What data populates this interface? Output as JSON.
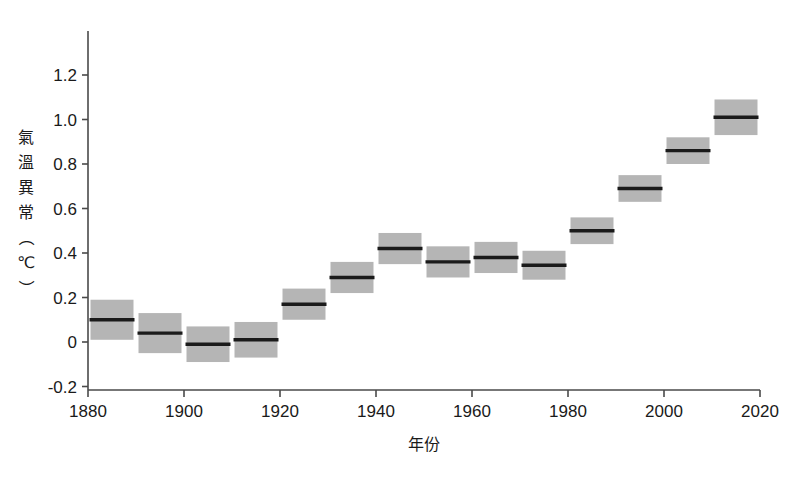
{
  "figure": {
    "cropped_header_text": "······ ···· ·· ·· ·······"
  },
  "chart_data": {
    "type": "bar",
    "title": "",
    "subtitle": "",
    "xlabel": "年份",
    "ylabel": "氣溫異常（℃）",
    "ylabel_chars": [
      "氣",
      "溫",
      "異",
      "常",
      "（",
      "℃",
      "）"
    ],
    "xlim": [
      1880,
      2020
    ],
    "ylim": [
      -0.3,
      1.25
    ],
    "grid": false,
    "legend": null,
    "xticks": [
      "1880",
      "1900",
      "1920",
      "1940",
      "1960",
      "1980",
      "2000",
      "2020"
    ],
    "xtick_values": [
      1880,
      1900,
      1920,
      1940,
      1960,
      1980,
      2000,
      2020
    ],
    "yticks": [
      "1.2",
      "1.0",
      "0.8",
      "0.6",
      "0.4",
      "0.2",
      "0",
      "-0.2"
    ],
    "ytick_values": [
      1.2,
      1.0,
      0.8,
      0.6,
      0.4,
      0.2,
      0,
      -0.2
    ],
    "categories": [
      "1880s",
      "1890s",
      "1900s",
      "1910s",
      "1920s",
      "1930s",
      "1940s",
      "1950s",
      "1960s",
      "1970s",
      "1980s",
      "1990s",
      "2000s",
      "2010s"
    ],
    "x_start": [
      1880,
      1890,
      1900,
      1910,
      1920,
      1930,
      1940,
      1950,
      1960,
      1970,
      1980,
      1990,
      2000,
      2010
    ],
    "x_end": [
      1890,
      1900,
      1910,
      1920,
      1930,
      1940,
      1950,
      1960,
      1970,
      1980,
      1990,
      2000,
      2010,
      2020
    ],
    "values": [
      0.1,
      0.04,
      -0.01,
      0.01,
      0.17,
      0.29,
      0.42,
      0.36,
      0.38,
      0.345,
      0.5,
      0.69,
      0.86,
      1.01
    ],
    "range_low": [
      0.01,
      -0.05,
      -0.09,
      -0.07,
      0.1,
      0.22,
      0.35,
      0.29,
      0.31,
      0.28,
      0.44,
      0.63,
      0.8,
      0.93
    ],
    "range_high": [
      0.19,
      0.13,
      0.07,
      0.09,
      0.24,
      0.36,
      0.49,
      0.43,
      0.45,
      0.41,
      0.56,
      0.75,
      0.92,
      1.09
    ],
    "colors": {
      "box_fill": "#b5b5b5",
      "median_line": "#1a1a1a",
      "axis": "#4a4a4a",
      "background": "#ffffff"
    }
  }
}
